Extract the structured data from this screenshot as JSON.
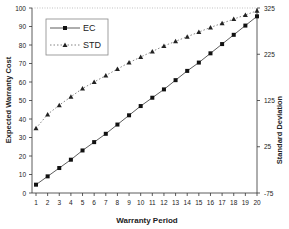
{
  "chart_data": {
    "type": "line",
    "title": "",
    "xlabel": "Warranty Period",
    "ylabel": "Expected Warranty Cost",
    "y2label": "Standard Deviation",
    "x": [
      1,
      2,
      3,
      4,
      5,
      6,
      7,
      8,
      9,
      10,
      11,
      12,
      13,
      14,
      15,
      16,
      17,
      18,
      19,
      20
    ],
    "ylim": [
      0,
      100
    ],
    "y2lim": [
      -75,
      325
    ],
    "yticks": [
      0,
      10,
      20,
      30,
      40,
      50,
      60,
      70,
      80,
      90,
      100
    ],
    "y2ticks": [
      -75,
      25,
      125,
      225,
      325
    ],
    "grid": false,
    "legend_position": "upper-left",
    "series": [
      {
        "name": "EC",
        "axis": "left",
        "marker": "square",
        "line": "solid",
        "values": [
          4.5,
          9,
          13.5,
          18,
          23,
          27.5,
          32,
          37,
          42,
          47,
          51.5,
          56,
          61,
          66,
          70.5,
          75.5,
          80.5,
          85.5,
          90.5,
          95.5
        ]
      },
      {
        "name": "STD",
        "axis": "right",
        "marker": "triangle",
        "line": "dotted",
        "values": [
          65,
          95,
          115,
          133,
          151,
          165,
          179,
          193,
          207,
          219,
          231,
          243,
          253,
          263,
          273,
          283,
          292,
          301,
          310,
          319
        ]
      }
    ]
  },
  "legend": {
    "ec_label": "EC",
    "std_label": "STD"
  },
  "axes": {
    "x_title": "Warranty Period",
    "y_title": "Expected Warranty Cost",
    "y2_title": "Standard Deviation"
  }
}
